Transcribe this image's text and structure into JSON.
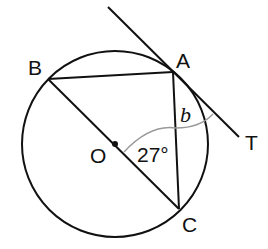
{
  "diagram": {
    "type": "circle-geometry",
    "points": {
      "A": {
        "label": "A"
      },
      "B": {
        "label": "B"
      },
      "C": {
        "label": "C"
      },
      "O": {
        "label": "O"
      },
      "T": {
        "label": "T"
      }
    },
    "angle_labels": {
      "given": "27°",
      "unknown": "b"
    },
    "colors": {
      "lines": "#111111",
      "arc": "#999999"
    }
  }
}
